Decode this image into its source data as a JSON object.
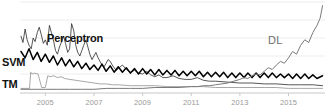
{
  "chart_data": {
    "type": "line",
    "title": "",
    "subtitle": "",
    "xlabel": "",
    "ylabel": "",
    "grid": true,
    "legend_position": "inline-annotations",
    "xlim": [
      2004.0,
      2016.5
    ],
    "ylim": [
      0,
      100
    ],
    "x_tick_labels": [
      "2005",
      "2007",
      "2009",
      "2011",
      "2013",
      "2015"
    ],
    "x_tick_values": [
      2005,
      2007,
      2009,
      2011,
      2013,
      2015
    ],
    "y_tick_labels": [],
    "annotations": [
      {
        "text": "Perceptron",
        "color": "#111111",
        "bold": true
      },
      {
        "text": "SVM",
        "color": "#111111",
        "bold": true
      },
      {
        "text": "TM",
        "color": "#111111",
        "bold": true
      },
      {
        "text": "DL",
        "color": "#6e6e6e",
        "bold": false
      }
    ],
    "series": [
      {
        "name": "Perceptron",
        "color": "#2b2b2b",
        "width": 0.8,
        "x": [
          2004.0,
          2004.08,
          2004.17,
          2004.25,
          2004.33,
          2004.42,
          2004.5,
          2004.58,
          2004.67,
          2004.75,
          2004.83,
          2004.92,
          2005.0,
          2005.08,
          2005.17,
          2005.25,
          2005.33,
          2005.42,
          2005.5,
          2005.58,
          2005.67,
          2005.75,
          2005.83,
          2005.92,
          2006.0,
          2006.08,
          2006.17,
          2006.25,
          2006.33,
          2006.42,
          2006.5,
          2006.58,
          2006.67,
          2006.75,
          2006.83,
          2006.92,
          2007.0,
          2007.08,
          2007.17,
          2007.25,
          2007.33,
          2007.42,
          2007.5,
          2007.58,
          2007.67,
          2007.75,
          2007.83,
          2007.92,
          2008.0,
          2008.17,
          2008.33,
          2008.5,
          2008.67,
          2008.83,
          2009.0,
          2009.17,
          2009.33,
          2009.5,
          2009.67,
          2009.83,
          2010.0,
          2010.25,
          2010.5,
          2010.75,
          2011.0,
          2011.25,
          2011.5,
          2011.75,
          2012.0,
          2012.5,
          2013.0,
          2013.5,
          2014.0,
          2014.5,
          2015.0,
          2015.5,
          2016.0,
          2016.4
        ],
        "values": [
          62,
          55,
          70,
          58,
          52,
          48,
          60,
          56,
          66,
          72,
          64,
          54,
          58,
          52,
          74,
          66,
          58,
          46,
          42,
          50,
          56,
          62,
          54,
          44,
          48,
          76,
          68,
          52,
          44,
          40,
          46,
          52,
          58,
          50,
          42,
          36,
          40,
          44,
          38,
          34,
          30,
          28,
          32,
          36,
          34,
          30,
          27,
          24,
          26,
          30,
          25,
          22,
          24,
          21,
          20,
          23,
          19,
          17,
          19,
          16,
          16,
          18,
          15,
          14,
          14,
          16,
          13,
          12,
          12,
          11,
          10,
          10,
          9,
          9,
          8,
          8,
          8,
          7
        ]
      },
      {
        "name": "SVM",
        "color": "#000000",
        "width": 1.5,
        "x": [
          2004.0,
          2004.17,
          2004.33,
          2004.5,
          2004.67,
          2004.83,
          2005.0,
          2005.17,
          2005.33,
          2005.5,
          2005.67,
          2005.83,
          2006.0,
          2006.17,
          2006.33,
          2006.5,
          2006.67,
          2006.83,
          2007.0,
          2007.17,
          2007.33,
          2007.5,
          2007.67,
          2007.83,
          2008.0,
          2008.17,
          2008.33,
          2008.5,
          2008.67,
          2008.83,
          2009.0,
          2009.17,
          2009.33,
          2009.5,
          2009.67,
          2009.83,
          2010.0,
          2010.17,
          2010.33,
          2010.5,
          2010.67,
          2010.83,
          2011.0,
          2011.17,
          2011.33,
          2011.5,
          2011.67,
          2011.83,
          2012.0,
          2012.17,
          2012.33,
          2012.5,
          2012.67,
          2012.83,
          2013.0,
          2013.17,
          2013.33,
          2013.5,
          2013.67,
          2013.83,
          2014.0,
          2014.17,
          2014.33,
          2014.5,
          2014.67,
          2014.83,
          2015.0,
          2015.17,
          2015.33,
          2015.5,
          2015.67,
          2015.83,
          2016.0,
          2016.17,
          2016.4
        ],
        "values": [
          45,
          38,
          48,
          36,
          44,
          34,
          42,
          33,
          40,
          30,
          38,
          29,
          36,
          28,
          34,
          26,
          32,
          25,
          30,
          24,
          31,
          23,
          29,
          22,
          28,
          22,
          27,
          21,
          26,
          20,
          26,
          20,
          25,
          19,
          25,
          19,
          24,
          19,
          24,
          18,
          23,
          18,
          23,
          18,
          23,
          17,
          22,
          17,
          22,
          17,
          22,
          16,
          21,
          16,
          21,
          16,
          21,
          16,
          21,
          16,
          21,
          16,
          21,
          16,
          20,
          16,
          20,
          15,
          20,
          15,
          20,
          15,
          19,
          15,
          18
        ]
      },
      {
        "name": "TM",
        "color": "#9d9d9d",
        "width": 0.9,
        "x": [
          2004.0,
          2004.2,
          2004.35,
          2004.4,
          2004.45,
          2004.55,
          2004.7,
          2004.85,
          2004.95,
          2005.0,
          2005.1,
          2005.2,
          2005.35,
          2005.5,
          2005.65,
          2005.8,
          2006.0,
          2006.25,
          2006.5,
          2006.75,
          2007.0,
          2007.25,
          2007.5,
          2007.75,
          2008.0,
          2008.5,
          2009.0,
          2009.5,
          2010.0,
          2010.5,
          2011.0,
          2011.5,
          2012.0,
          2012.5,
          2013.0,
          2013.5,
          2014.0,
          2014.5,
          2015.0,
          2015.5,
          2016.0,
          2016.4
        ],
        "values": [
          4,
          4,
          4,
          22,
          20,
          21,
          20,
          5,
          5,
          5,
          18,
          17,
          18,
          16,
          17,
          15,
          14,
          13,
          12,
          11,
          10,
          9,
          9,
          8,
          8,
          7,
          7,
          7,
          6,
          6,
          6,
          6,
          5,
          5,
          5,
          5,
          5,
          5,
          4,
          4,
          4,
          4
        ]
      },
      {
        "name": "DL",
        "color": "#7a7a7a",
        "width": 1.0,
        "x": [
          2004.0,
          2004.5,
          2005.0,
          2005.5,
          2006.0,
          2006.5,
          2007.0,
          2007.5,
          2008.0,
          2008.5,
          2009.0,
          2009.5,
          2010.0,
          2010.5,
          2011.0,
          2011.25,
          2011.5,
          2011.75,
          2012.0,
          2012.25,
          2012.5,
          2012.75,
          2013.0,
          2013.17,
          2013.33,
          2013.5,
          2013.67,
          2013.83,
          2014.0,
          2014.17,
          2014.33,
          2014.5,
          2014.67,
          2014.83,
          2015.0,
          2015.17,
          2015.33,
          2015.5,
          2015.67,
          2015.83,
          2016.0,
          2016.17,
          2016.3,
          2016.4
        ],
        "values": [
          3,
          3,
          3,
          3,
          3,
          3,
          3,
          4,
          4,
          4,
          4,
          5,
          5,
          5,
          6,
          6,
          7,
          7,
          8,
          9,
          10,
          12,
          14,
          16,
          15,
          18,
          20,
          19,
          23,
          27,
          25,
          30,
          34,
          32,
          38,
          45,
          42,
          52,
          58,
          55,
          66,
          74,
          82,
          96
        ]
      }
    ]
  },
  "axis": {
    "tick_color": "#9a9a9a",
    "gridline_color": "#ededed",
    "baseline_color": "#c8c8c8"
  },
  "labels": {
    "perceptron": "Perceptron",
    "svm": "SVM",
    "tm": "TM",
    "dl": "DL"
  }
}
